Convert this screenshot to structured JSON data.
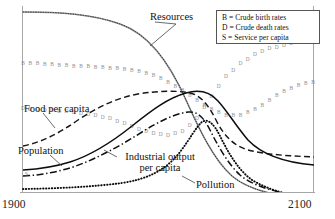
{
  "chart_data": {
    "type": "line",
    "title": "",
    "xlabel": "",
    "ylabel": "",
    "xlim": [
      1900,
      2100
    ],
    "ylim": [
      0,
      1
    ],
    "grid": false,
    "x_tick_labels": [
      "1900",
      "2100"
    ],
    "legend_position": "top-right",
    "legend_entries": [
      "B = Crude birth rates",
      "D = Crude death rates",
      "S = Service per capita"
    ],
    "annotations": [
      "Resources",
      "Food per capita",
      "Population",
      "Industrial output per capita",
      "Pollution"
    ],
    "series": [
      {
        "name": "Resources",
        "style": "solid-gray-with-open-markers",
        "label": "Resources",
        "x": [
          1900,
          1910,
          1920,
          1930,
          1940,
          1950,
          1960,
          1970,
          1980,
          1990,
          2000,
          2010,
          2020,
          2030,
          2040,
          2050,
          2060,
          2070,
          2080,
          2090,
          2100
        ],
        "values": [
          0.97,
          0.97,
          0.965,
          0.96,
          0.955,
          0.945,
          0.935,
          0.92,
          0.9,
          0.87,
          0.83,
          0.77,
          0.69,
          0.59,
          0.47,
          0.36,
          0.26,
          0.18,
          0.12,
          0.08,
          0.05
        ]
      },
      {
        "name": "Food per capita",
        "style": "dashed",
        "label": "Food per capita",
        "x": [
          1900,
          1910,
          1920,
          1930,
          1940,
          1950,
          1960,
          1970,
          1980,
          1990,
          2000,
          2010,
          2020,
          2030,
          2040,
          2050,
          2060,
          2070,
          2080,
          2090,
          2100
        ],
        "values": [
          0.28,
          0.3,
          0.33,
          0.38,
          0.44,
          0.5,
          0.56,
          0.6,
          0.63,
          0.65,
          0.665,
          0.67,
          0.665,
          0.63,
          0.54,
          0.44,
          0.37,
          0.33,
          0.31,
          0.3,
          0.295
        ]
      },
      {
        "name": "Population",
        "style": "solid",
        "label": "Population",
        "x": [
          1900,
          1910,
          1920,
          1930,
          1940,
          1950,
          1960,
          1970,
          1980,
          1990,
          2000,
          2010,
          2020,
          2030,
          2040,
          2050,
          2060,
          2070,
          2080,
          2090,
          2100
        ],
        "values": [
          0.13,
          0.14,
          0.16,
          0.19,
          0.22,
          0.26,
          0.31,
          0.38,
          0.46,
          0.55,
          0.63,
          0.69,
          0.715,
          0.715,
          0.7,
          0.66,
          0.6,
          0.53,
          0.47,
          0.43,
          0.4
        ]
      },
      {
        "name": "Industrial output per capita",
        "style": "dash-dot",
        "label": "Industrial output per capita",
        "x": [
          1900,
          1910,
          1920,
          1930,
          1940,
          1950,
          1960,
          1970,
          1980,
          1990,
          2000,
          2010,
          2020,
          2030,
          2040,
          2050,
          2060,
          2070,
          2080,
          2090,
          2100
        ],
        "values": [
          0.1,
          0.11,
          0.13,
          0.16,
          0.2,
          0.25,
          0.31,
          0.38,
          0.46,
          0.54,
          0.6,
          0.62,
          0.58,
          0.46,
          0.33,
          0.23,
          0.16,
          0.11,
          0.08,
          0.06,
          0.05
        ]
      },
      {
        "name": "Pollution",
        "style": "dotted-heavy",
        "label": "Pollution",
        "x": [
          1900,
          1910,
          1920,
          1930,
          1940,
          1950,
          1960,
          1970,
          1980,
          1990,
          2000,
          2010,
          2020,
          2030,
          2040,
          2050,
          2060,
          2070,
          2080,
          2090,
          2100
        ],
        "values": [
          0.02,
          0.02,
          0.02,
          0.025,
          0.03,
          0.035,
          0.045,
          0.06,
          0.08,
          0.11,
          0.16,
          0.24,
          0.36,
          0.5,
          0.58,
          0.52,
          0.4,
          0.28,
          0.18,
          0.11,
          0.06
        ]
      },
      {
        "name": "Crude birth rates",
        "marker": "B",
        "style": "open-square-markers",
        "x": [
          1900,
          1910,
          1920,
          1930,
          1940,
          1950,
          1960,
          1970,
          1980,
          1990,
          2000,
          2010,
          2020,
          2030,
          2040,
          2050,
          2060,
          2070,
          2080,
          2090,
          2100
        ],
        "values": [
          0.7,
          0.7,
          0.695,
          0.69,
          0.685,
          0.68,
          0.675,
          0.67,
          0.655,
          0.635,
          0.6,
          0.555,
          0.5,
          0.45,
          0.42,
          0.42,
          0.45,
          0.5,
          0.55,
          0.58,
          0.6
        ]
      },
      {
        "name": "Crude death rates",
        "marker": "D",
        "style": "open-square-markers",
        "x": [
          1900,
          1910,
          1920,
          1930,
          1940,
          1950,
          1960,
          1970,
          1980,
          1990,
          2000,
          2010,
          2020,
          2030,
          2040,
          2050,
          2060,
          2070,
          2080,
          2090,
          2100
        ],
        "values": [
          0.455,
          0.45,
          0.445,
          0.44,
          0.43,
          0.42,
          0.4,
          0.375,
          0.345,
          0.32,
          0.31,
          0.33,
          0.4,
          0.52,
          0.63,
          0.7,
          0.75,
          0.78,
          0.8,
          0.815,
          0.82
        ]
      },
      {
        "name": "Service per capita",
        "marker": "S",
        "style": "axis-origin-marker",
        "x": [
          1900
        ],
        "values": [
          0.1
        ]
      }
    ]
  },
  "axis": {
    "left_tick_start": "1900",
    "right_tick_end": "2100"
  },
  "legend": {
    "items": [
      {
        "key": "B",
        "text": "B = Crude birth rates"
      },
      {
        "key": "D",
        "text": "D = Crude death rates"
      },
      {
        "key": "S",
        "text": "S = Service per capita"
      }
    ]
  },
  "labels": {
    "resources": "Resources",
    "food_per_capita": "Food per capita",
    "population": "Population",
    "industrial_output_line1": "Industrial output",
    "industrial_output_line2": "per capita",
    "pollution": "Pollution"
  },
  "colors": {
    "ink": "#111111",
    "axis": "#9a9a9a",
    "resources_curve": "#8a8a8a",
    "marker": "#8f8f8f",
    "background": "#ffffff"
  }
}
